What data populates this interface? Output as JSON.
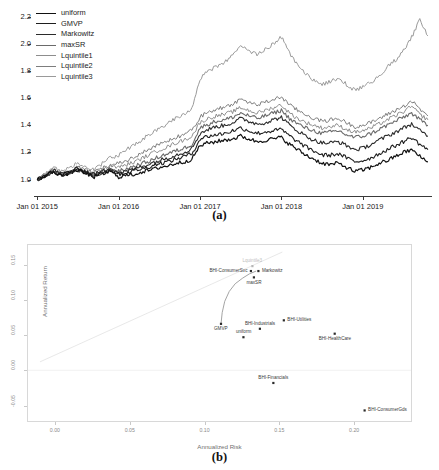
{
  "figure": {
    "panel_a_caption": "(a)",
    "panel_b_caption": "(b)"
  },
  "chart_data": [
    {
      "id": "panel_a",
      "type": "line",
      "title": "",
      "xlabel": "",
      "ylabel": "",
      "grid": false,
      "legend_position": "top-left",
      "xtick_labels": [
        "Jan 01 2015",
        "Jan 01 2016",
        "Jan 01 2017",
        "Jan 01 2018",
        "Jan 01 2019"
      ],
      "ytick_labels": [
        "1.0",
        "1.2",
        "1.4",
        "1.6",
        "1.8",
        "2.0",
        "2.2"
      ],
      "ylim": [
        0.93,
        2.28
      ],
      "xlim": [
        2014.96,
        2019.85
      ],
      "x": [
        2015.0,
        2015.1,
        2015.2,
        2015.3,
        2015.4,
        2015.5,
        2015.6,
        2015.7,
        2015.8,
        2015.9,
        2016.0,
        2016.1,
        2016.2,
        2016.3,
        2016.4,
        2016.5,
        2016.6,
        2016.7,
        2016.8,
        2016.9,
        2017.0,
        2017.1,
        2017.2,
        2017.3,
        2017.4,
        2017.5,
        2017.6,
        2017.7,
        2017.8,
        2017.9,
        2018.0,
        2018.1,
        2018.2,
        2018.3,
        2018.4,
        2018.5,
        2018.6,
        2018.7,
        2018.8,
        2018.9,
        2019.0,
        2019.1,
        2019.2,
        2019.3,
        2019.4,
        2019.5,
        2019.6,
        2019.7,
        2019.8
      ],
      "series": [
        {
          "name": "Lquintile3",
          "color": "#9a9a9a",
          "width": 1.0,
          "values": [
            1.0,
            1.04,
            1.09,
            1.06,
            1.09,
            1.12,
            1.1,
            1.07,
            1.12,
            1.16,
            1.18,
            1.22,
            1.26,
            1.3,
            1.34,
            1.38,
            1.41,
            1.45,
            1.48,
            1.53,
            1.74,
            1.8,
            1.83,
            1.86,
            1.92,
            1.98,
            1.95,
            1.92,
            1.96,
            2.0,
            2.05,
            1.93,
            1.85,
            1.78,
            1.73,
            1.7,
            1.72,
            1.75,
            1.7,
            1.66,
            1.68,
            1.72,
            1.76,
            1.83,
            1.88,
            1.95,
            2.05,
            2.18,
            2.06
          ]
        },
        {
          "name": "Lquintile2",
          "color": "#7d7d7d",
          "width": 1.0,
          "values": [
            1.0,
            1.03,
            1.07,
            1.04,
            1.06,
            1.09,
            1.07,
            1.05,
            1.08,
            1.11,
            1.12,
            1.14,
            1.17,
            1.2,
            1.23,
            1.26,
            1.28,
            1.31,
            1.33,
            1.36,
            1.46,
            1.5,
            1.52,
            1.53,
            1.56,
            1.59,
            1.57,
            1.55,
            1.57,
            1.59,
            1.61,
            1.55,
            1.51,
            1.48,
            1.45,
            1.43,
            1.44,
            1.45,
            1.42,
            1.39,
            1.4,
            1.42,
            1.45,
            1.48,
            1.51,
            1.54,
            1.58,
            1.52,
            1.47
          ]
        },
        {
          "name": "Lquintile1",
          "color": "#8d8d8d",
          "width": 1.0,
          "values": [
            1.0,
            1.03,
            1.07,
            1.04,
            1.06,
            1.08,
            1.06,
            1.04,
            1.07,
            1.1,
            1.09,
            1.11,
            1.13,
            1.16,
            1.19,
            1.22,
            1.24,
            1.27,
            1.29,
            1.32,
            1.42,
            1.45,
            1.47,
            1.48,
            1.5,
            1.53,
            1.51,
            1.49,
            1.51,
            1.53,
            1.55,
            1.49,
            1.45,
            1.42,
            1.4,
            1.38,
            1.39,
            1.4,
            1.37,
            1.35,
            1.36,
            1.38,
            1.41,
            1.44,
            1.47,
            1.5,
            1.54,
            1.48,
            1.44
          ]
        },
        {
          "name": "maxSR",
          "color": "#6a6a6a",
          "width": 1.1,
          "values": [
            1.0,
            1.03,
            1.06,
            1.03,
            1.05,
            1.07,
            1.05,
            1.03,
            1.05,
            1.08,
            1.06,
            1.08,
            1.1,
            1.12,
            1.14,
            1.17,
            1.19,
            1.21,
            1.23,
            1.26,
            1.38,
            1.41,
            1.43,
            1.44,
            1.46,
            1.49,
            1.47,
            1.45,
            1.47,
            1.49,
            1.51,
            1.45,
            1.41,
            1.38,
            1.36,
            1.34,
            1.35,
            1.36,
            1.33,
            1.31,
            1.32,
            1.34,
            1.37,
            1.4,
            1.43,
            1.46,
            1.49,
            1.44,
            1.4
          ]
        },
        {
          "name": "Markowitz",
          "color": "#2b2b2b",
          "width": 1.1,
          "values": [
            1.0,
            1.03,
            1.07,
            1.04,
            1.06,
            1.08,
            1.06,
            1.04,
            1.06,
            1.09,
            1.05,
            1.06,
            1.08,
            1.1,
            1.12,
            1.14,
            1.16,
            1.18,
            1.2,
            1.23,
            1.34,
            1.37,
            1.39,
            1.4,
            1.42,
            1.45,
            1.43,
            1.41,
            1.42,
            1.44,
            1.46,
            1.4,
            1.36,
            1.32,
            1.29,
            1.27,
            1.27,
            1.28,
            1.25,
            1.22,
            1.23,
            1.26,
            1.29,
            1.32,
            1.35,
            1.38,
            1.41,
            1.36,
            1.32
          ]
        },
        {
          "name": "GMVP",
          "color": "#1e1e1e",
          "width": 1.1,
          "values": [
            1.0,
            1.03,
            1.06,
            1.03,
            1.05,
            1.07,
            1.05,
            1.03,
            1.05,
            1.07,
            1.04,
            1.05,
            1.07,
            1.08,
            1.1,
            1.12,
            1.13,
            1.15,
            1.17,
            1.19,
            1.3,
            1.32,
            1.33,
            1.34,
            1.36,
            1.38,
            1.36,
            1.34,
            1.35,
            1.36,
            1.37,
            1.32,
            1.28,
            1.24,
            1.21,
            1.18,
            1.18,
            1.19,
            1.16,
            1.13,
            1.14,
            1.16,
            1.19,
            1.22,
            1.25,
            1.28,
            1.31,
            1.26,
            1.22
          ]
        },
        {
          "name": "uniform",
          "color": "#111111",
          "width": 1.2,
          "values": [
            1.0,
            1.03,
            1.06,
            1.03,
            1.05,
            1.07,
            1.04,
            1.02,
            1.04,
            1.06,
            1.02,
            1.03,
            1.04,
            1.06,
            1.07,
            1.09,
            1.1,
            1.12,
            1.13,
            1.15,
            1.25,
            1.27,
            1.28,
            1.29,
            1.3,
            1.32,
            1.3,
            1.28,
            1.29,
            1.3,
            1.31,
            1.26,
            1.22,
            1.18,
            1.15,
            1.12,
            1.11,
            1.12,
            1.09,
            1.06,
            1.07,
            1.09,
            1.12,
            1.14,
            1.17,
            1.2,
            1.22,
            1.17,
            1.13
          ]
        }
      ]
    },
    {
      "id": "panel_b",
      "type": "scatter",
      "title": "",
      "xlabel": "Annualized Risk",
      "ylabel": "Annualized Return",
      "grid": false,
      "legend_position": "none",
      "xtick_labels": [
        "0.00",
        "0.05",
        "0.10",
        "0.15",
        "0.20"
      ],
      "xtick_values": [
        0.0,
        0.05,
        0.1,
        0.15,
        0.2
      ],
      "ytick_labels": [
        "0.15",
        "0.10",
        "0.05",
        "0.00",
        "-0.05"
      ],
      "ytick_values": [
        0.15,
        0.1,
        0.05,
        0.0,
        -0.05
      ],
      "xlim": [
        -0.018,
        0.238
      ],
      "ylim": [
        -0.072,
        0.178
      ],
      "zero_line_y": 0.0,
      "points": [
        {
          "label": "Lquintile3",
          "x": 0.132,
          "y": 0.148,
          "label_pos": "above",
          "dim": true
        },
        {
          "label": "Markowitz",
          "x": 0.136,
          "y": 0.141,
          "label_pos": "right",
          "dim": false
        },
        {
          "label": "BHI-ConsumerSvc",
          "x": 0.131,
          "y": 0.141,
          "label_pos": "left",
          "dim": false
        },
        {
          "label": "maxSR",
          "x": 0.133,
          "y": 0.132,
          "label_pos": "below",
          "dim": false
        },
        {
          "label": "GMVP",
          "x": 0.111,
          "y": 0.066,
          "label_pos": "below",
          "dim": false
        },
        {
          "label": "uniform",
          "x": 0.126,
          "y": 0.047,
          "label_pos": "above",
          "dim": false
        },
        {
          "label": "BHI-Industrials",
          "x": 0.137,
          "y": 0.059,
          "label_pos": "above",
          "dim": false
        },
        {
          "label": "BHI-Utilities",
          "x": 0.153,
          "y": 0.071,
          "label_pos": "right",
          "dim": false
        },
        {
          "label": "BHI-HealthCare",
          "x": 0.187,
          "y": 0.052,
          "label_pos": "below",
          "dim": false
        },
        {
          "label": "BHI-Financials",
          "x": 0.146,
          "y": -0.018,
          "label_pos": "above",
          "dim": false
        },
        {
          "label": "BHI-ConsumerGds",
          "x": 0.207,
          "y": -0.057,
          "label_pos": "right",
          "dim": false
        }
      ],
      "frontier_curve": {
        "name": "efficient-frontier",
        "color": "#9a9a9a",
        "points": [
          [
            0.111,
            0.066
          ],
          [
            0.1118,
            0.082
          ],
          [
            0.1135,
            0.098
          ],
          [
            0.1165,
            0.112
          ],
          [
            0.1205,
            0.123
          ],
          [
            0.1255,
            0.131
          ],
          [
            0.13,
            0.137
          ],
          [
            0.1345,
            0.141
          ]
        ]
      },
      "diagonal_guide": {
        "name": "capital-allocation-line",
        "color": "#e2e2e2",
        "points": [
          [
            -0.01,
            0.012
          ],
          [
            0.152,
            0.168
          ]
        ]
      }
    }
  ]
}
